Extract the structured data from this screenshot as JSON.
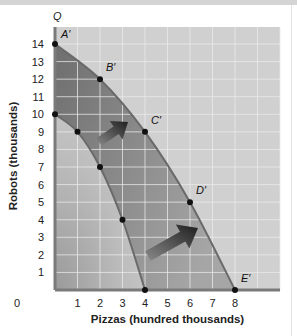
{
  "chart_data": {
    "type": "line",
    "title": "",
    "xlabel": "Pizzas (hundred thousands)",
    "ylabel": "Robots (thousands)",
    "y_axis_letter": "Q",
    "xlim": [
      0,
      10
    ],
    "ylim": [
      0,
      15
    ],
    "x_ticks": [
      "0",
      "1",
      "2",
      "3",
      "4",
      "5",
      "6",
      "7",
      "8"
    ],
    "y_ticks": [
      "1",
      "2",
      "3",
      "4",
      "5",
      "6",
      "7",
      "8",
      "9",
      "10",
      "11",
      "12",
      "13",
      "14"
    ],
    "grid": true,
    "series": [
      {
        "name": "Original PPF",
        "points": [
          [
            0,
            10
          ],
          [
            1,
            9
          ],
          [
            2,
            7
          ],
          [
            3,
            4
          ],
          [
            4,
            0
          ]
        ],
        "labels": [
          "",
          "",
          "",
          "",
          ""
        ]
      },
      {
        "name": "Shifted PPF",
        "points": [
          [
            0,
            14
          ],
          [
            2,
            12
          ],
          [
            4,
            9
          ],
          [
            6,
            5
          ],
          [
            8,
            0
          ]
        ],
        "labels": [
          "A′",
          "B′",
          "C′",
          "D′",
          "E′"
        ]
      }
    ],
    "annotations": [
      "Arrow shifting PPF outward (upper)",
      "Arrow shifting PPF outward (lower)"
    ]
  },
  "colors": {
    "plot_bg": "#d0d0d0",
    "grid": "#ececec",
    "curve": "#6a6a6a",
    "axis": "#7a7a7a",
    "point": "#111111"
  }
}
